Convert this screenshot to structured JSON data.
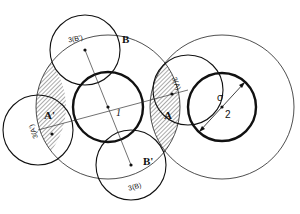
{
  "diagram": {
    "type": "overlapping-circles",
    "circles": [
      {
        "id": "1",
        "label": "1",
        "style": "thick"
      },
      {
        "id": "2",
        "label": "2",
        "style": "thick"
      },
      {
        "id": "shell-1",
        "label": "",
        "style": "thin"
      },
      {
        "id": "shell-2",
        "label": "",
        "style": "thin"
      },
      {
        "id": "3B'",
        "label": "3(B')",
        "style": "medium"
      },
      {
        "id": "3B",
        "label": "3(B)",
        "style": "medium"
      },
      {
        "id": "3A",
        "label": "3(A)",
        "style": "medium"
      },
      {
        "id": "3A'",
        "label": "3(A')",
        "style": "medium"
      }
    ],
    "regions": {
      "A": "A",
      "A_prime": "A'",
      "B": "B",
      "B_prime": "B'"
    },
    "sigma": "σ",
    "colors": {
      "stroke": "#111111",
      "hatch": "#555555",
      "background": "#ffffff"
    }
  }
}
